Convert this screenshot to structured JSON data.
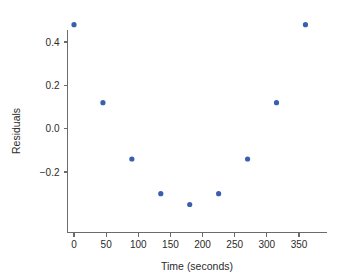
{
  "chart_data": {
    "type": "scatter",
    "title": "",
    "xlabel": "Time (seconds)",
    "ylabel": "Residuals",
    "x": [
      0,
      45,
      90,
      135,
      180,
      225,
      270,
      315,
      360
    ],
    "values": [
      0.48,
      0.12,
      -0.14,
      -0.3,
      -0.35,
      -0.3,
      -0.14,
      0.12,
      0.48
    ],
    "series": [
      {
        "name": "Residuals",
        "points": [
          {
            "x": 0,
            "y": 0.48
          },
          {
            "x": 45,
            "y": 0.12
          },
          {
            "x": 90,
            "y": -0.14
          },
          {
            "x": 135,
            "y": -0.3
          },
          {
            "x": 180,
            "y": -0.35
          },
          {
            "x": 225,
            "y": -0.3
          },
          {
            "x": 270,
            "y": -0.14
          },
          {
            "x": 315,
            "y": 0.12
          },
          {
            "x": 360,
            "y": 0.48
          }
        ]
      }
    ],
    "xticks": [
      0,
      50,
      100,
      150,
      200,
      250,
      300,
      350
    ],
    "xtick_labels": [
      "0",
      "50",
      "100",
      "150",
      "200",
      "250",
      "300",
      "350"
    ],
    "yticks": [
      0.4,
      0.2,
      0.0,
      -0.2
    ],
    "ytick_labels": [
      "0.4",
      "0.2",
      "0.0",
      "−0.2"
    ],
    "xlim": [
      -11,
      392
    ],
    "ylim": [
      -0.42,
      0.56
    ],
    "grid": false,
    "legend": false,
    "legend_position": "none",
    "point_color": "#3a5fae",
    "axis_color": "#6b6b6b",
    "text_color": "#2b2b2b",
    "background": "#ffffff",
    "point_size": 2.6
  }
}
